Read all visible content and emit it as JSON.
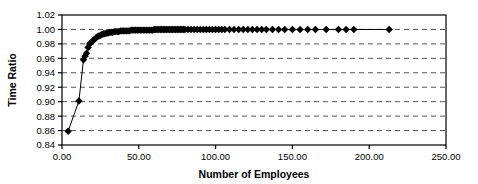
{
  "chart_data": {
    "type": "line",
    "title": "",
    "subtitle": "",
    "xlabel": "Number of Employees",
    "ylabel": "Time Ratio",
    "xlim": [
      0,
      250
    ],
    "ylim": [
      0.84,
      1.02
    ],
    "xticks": [
      0,
      50,
      100,
      150,
      200,
      250
    ],
    "xtick_labels": [
      "0.00",
      "50.00",
      "100.00",
      "150.00",
      "200.00",
      "250.00"
    ],
    "yticks": [
      0.84,
      0.86,
      0.88,
      0.9,
      0.92,
      0.94,
      0.96,
      0.98,
      1.0,
      1.02
    ],
    "ytick_labels": [
      "0.84",
      "0.86",
      "0.88",
      "0.90",
      "0.92",
      "0.94",
      "0.96",
      "0.98",
      "1.00",
      "1.02"
    ],
    "grid": {
      "horizontal": true,
      "vertical": false,
      "style": "dashed",
      "color": "#555555"
    },
    "legend": {
      "visible": false,
      "position": "none"
    },
    "marker": {
      "shape": "diamond",
      "color": "#000000",
      "size": 5
    },
    "line": {
      "color": "#000000",
      "width": 1
    },
    "series": [
      {
        "name": "Time Ratio vs Number of Employees",
        "x": [
          4,
          11,
          14,
          15,
          16,
          17,
          18,
          19,
          20,
          21,
          22,
          23,
          24,
          25,
          26,
          27,
          28,
          29,
          30,
          31,
          32,
          33,
          34,
          35,
          36,
          37,
          38,
          39,
          40,
          41,
          42,
          43,
          44,
          45,
          46,
          47,
          48,
          49,
          50,
          51,
          52,
          53,
          54,
          55,
          56,
          57,
          58,
          59,
          60,
          61,
          62,
          63,
          64,
          65,
          66,
          67,
          68,
          69,
          70,
          71,
          72,
          73,
          74,
          75,
          76,
          77,
          78,
          79,
          80,
          82,
          84,
          86,
          88,
          90,
          92,
          94,
          96,
          98,
          100,
          102,
          104,
          106,
          109,
          112,
          115,
          118,
          121,
          124,
          127,
          130,
          133,
          137,
          141,
          145,
          150,
          155,
          160,
          165,
          172,
          180,
          185,
          190,
          213
        ],
        "y": [
          0.859,
          0.901,
          0.958,
          0.963,
          0.967,
          0.975,
          0.98,
          0.982,
          0.984,
          0.986,
          0.988,
          0.99,
          0.991,
          0.992,
          0.993,
          0.994,
          0.994,
          0.995,
          0.995,
          0.996,
          0.996,
          0.996,
          0.997,
          0.997,
          0.997,
          0.997,
          0.998,
          0.998,
          0.998,
          0.998,
          0.998,
          0.998,
          0.998,
          0.999,
          0.999,
          0.999,
          0.999,
          0.999,
          0.999,
          0.999,
          0.999,
          0.999,
          0.999,
          0.999,
          0.999,
          0.999,
          0.999,
          0.999,
          1.0,
          1.0,
          1.0,
          1.0,
          1.0,
          1.0,
          1.0,
          1.0,
          1.0,
          1.0,
          1.0,
          1.0,
          1.0,
          1.0,
          1.0,
          1.0,
          1.0,
          1.0,
          1.0,
          1.0,
          1.0,
          1.0,
          1.0,
          1.0,
          1.0,
          1.0,
          1.0,
          1.0,
          1.0,
          1.0,
          1.0,
          1.0,
          1.0,
          1.0,
          1.0,
          1.0,
          1.0,
          1.0,
          1.0,
          1.0,
          1.0,
          1.0,
          1.0,
          1.0,
          1.0,
          1.0,
          1.0,
          1.0,
          1.0,
          1.0,
          1.0,
          1.0,
          1.0,
          1.0,
          1.0
        ]
      }
    ]
  }
}
